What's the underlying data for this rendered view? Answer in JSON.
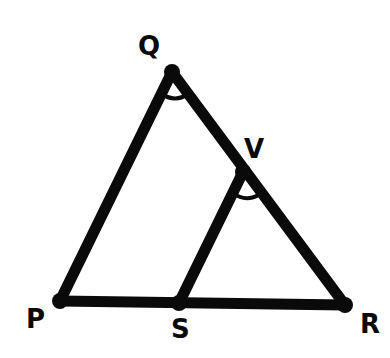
{
  "diagram": {
    "type": "geometry-triangle",
    "labels": {
      "Q": "Q",
      "V": "V",
      "P": "P",
      "S": "S",
      "R": "R"
    },
    "points": {
      "Q": [
        172,
        72
      ],
      "V": [
        243,
        172
      ],
      "P": [
        60,
        301
      ],
      "S": [
        179,
        303
      ],
      "R": [
        345,
        305
      ]
    },
    "segments": [
      [
        "P",
        "Q"
      ],
      [
        "Q",
        "R"
      ],
      [
        "P",
        "R"
      ],
      [
        "S",
        "V"
      ]
    ],
    "angle_marks": [
      "PQR",
      "SVR"
    ],
    "colors": {
      "stroke": "#0a0a0a",
      "background": "#ffffff"
    }
  }
}
